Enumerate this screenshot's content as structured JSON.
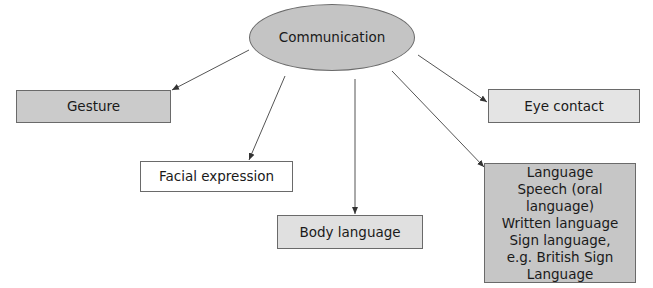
{
  "diagram": {
    "root": {
      "label": "Communication",
      "fill": "#c4c4c4"
    },
    "nodes": [
      {
        "id": "gesture",
        "label": "Gesture",
        "fill": "#cbcbcb"
      },
      {
        "id": "facial",
        "label": "Facial expression",
        "fill": "#ffffff"
      },
      {
        "id": "body",
        "label": "Body language",
        "fill": "#e0e0e0"
      },
      {
        "id": "eye",
        "label": "Eye contact",
        "fill": "#e4e4e4"
      },
      {
        "id": "language",
        "fill": "#c6c6c6",
        "lines": [
          "Language",
          "Speech (oral language)",
          "Written language",
          "Sign language,",
          "e.g. British Sign",
          "Language"
        ]
      }
    ],
    "edges": [
      {
        "from": "Communication",
        "to": "Gesture"
      },
      {
        "from": "Communication",
        "to": "Facial expression"
      },
      {
        "from": "Communication",
        "to": "Body language"
      },
      {
        "from": "Communication",
        "to": "Eye contact"
      },
      {
        "from": "Communication",
        "to": "Language"
      }
    ]
  }
}
